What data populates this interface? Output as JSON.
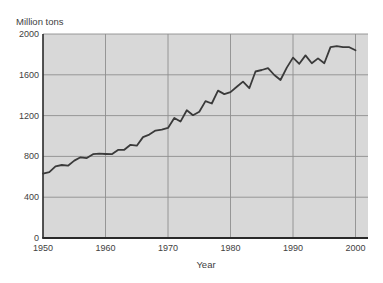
{
  "chart_data": {
    "type": "line",
    "title": "",
    "ylabel": "Million tons",
    "xlabel": "Year",
    "x_ticks": [
      1950,
      1960,
      1970,
      1980,
      1990,
      2000
    ],
    "y_ticks": [
      0,
      400,
      800,
      1200,
      1600,
      2000
    ],
    "xlim": [
      1950,
      2002
    ],
    "ylim": [
      0,
      2000
    ],
    "grid": true,
    "legend_position": "none",
    "x": [
      1950,
      1951,
      1952,
      1953,
      1954,
      1955,
      1956,
      1957,
      1958,
      1959,
      1960,
      1961,
      1962,
      1963,
      1964,
      1965,
      1966,
      1967,
      1968,
      1969,
      1970,
      1971,
      1972,
      1973,
      1974,
      1975,
      1976,
      1977,
      1978,
      1979,
      1980,
      1981,
      1982,
      1983,
      1984,
      1985,
      1986,
      1987,
      1988,
      1989,
      1990,
      1991,
      1992,
      1993,
      1994,
      1995,
      1996,
      1997,
      1998,
      1999,
      2000
    ],
    "values": [
      631,
      645,
      702,
      716,
      709,
      759,
      791,
      783,
      822,
      826,
      824,
      822,
      864,
      865,
      914,
      905,
      989,
      1014,
      1053,
      1063,
      1079,
      1177,
      1141,
      1253,
      1204,
      1237,
      1342,
      1319,
      1445,
      1411,
      1430,
      1482,
      1533,
      1469,
      1632,
      1647,
      1665,
      1598,
      1549,
      1671,
      1769,
      1708,
      1790,
      1714,
      1761,
      1713,
      1872,
      1881,
      1872,
      1871,
      1840
    ],
    "colors": {
      "page_background": "#ffffff",
      "plot_background": "#d8d8d8",
      "grid_line": "#8f8f8f",
      "axis_line": "#2a2a2a",
      "data_line": "#3a3a3a",
      "text": "#414141"
    }
  }
}
